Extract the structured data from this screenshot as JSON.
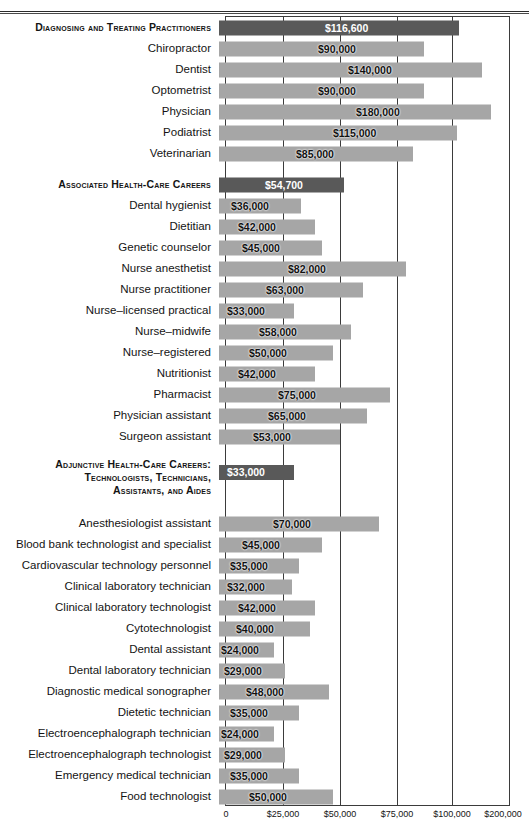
{
  "chart_data": {
    "type": "bar",
    "orientation": "horizontal",
    "title": "",
    "xlabel": "",
    "ylabel": "",
    "grid": true,
    "legend": null,
    "axis_note": "Non-linear axis: equal pixel spacing for 0, $25,000, $50,000, $75,000, $100,000, then $200,000",
    "axis_ticks": [
      {
        "label": "0",
        "value": 0,
        "pos": 226
      },
      {
        "label": "$25,000",
        "value": 25000,
        "pos": 283
      },
      {
        "label": "$50,000",
        "value": 50000,
        "pos": 340
      },
      {
        "label": "$75,000",
        "value": 75000,
        "pos": 397
      },
      {
        "label": "$100,000",
        "value": 100000,
        "pos": 452
      },
      {
        "label": "$200,000",
        "value": 200000,
        "pos": 503
      }
    ],
    "gridline_positions": [
      283,
      340,
      397,
      452
    ],
    "categories": [
      "Diagnosing and Treating Practitioners",
      "Chiropractor",
      "Dentist",
      "Optometrist",
      "Physician",
      "Podiatrist",
      "Veterinarian",
      "Associated Health-Care Careers",
      "Dental hygienist",
      "Dietitian",
      "Genetic counselor",
      "Nurse anesthetist",
      "Nurse practitioner",
      "Nurse–licensed practical",
      "Nurse–midwife",
      "Nurse–registered",
      "Nutritionist",
      "Pharmacist",
      "Physician assistant",
      "Surgeon assistant",
      "Adjunctive Health-Care Careers: Technologists, Technicians, Assistants, and Aides",
      "Anesthesiologist assistant",
      "Blood bank technologist and specialist",
      "Cardiovascular technology personnel",
      "Clinical laboratory technician",
      "Clinical laboratory technologist",
      "Cytotechnologist",
      "Dental assistant",
      "Dental laboratory technician",
      "Diagnostic medical sonographer",
      "Dietetic technician",
      "Electroencephalograph technician",
      "Electroencephalograph technologist",
      "Emergency medical technician",
      "Food technologist"
    ],
    "values": [
      116600,
      90000,
      140000,
      90000,
      180000,
      115000,
      85000,
      54700,
      36000,
      42000,
      45000,
      82000,
      63000,
      33000,
      58000,
      50000,
      42000,
      75000,
      65000,
      53000,
      33000,
      70000,
      45000,
      35000,
      32000,
      42000,
      40000,
      24000,
      29000,
      48000,
      35000,
      24000,
      29000,
      35000,
      50000
    ]
  },
  "colors": {
    "section_bar": "#595959",
    "item_bar": "#a6a6a6",
    "axis": "#3b3b3b",
    "text": "#141414",
    "value_on_dark": "#ffffff"
  },
  "rows": [
    {
      "kind": "section",
      "label": "Diagnosing and Treating Practitioners",
      "value": 116600,
      "value_text": "$116,600",
      "bar_w": 240,
      "label_x": 107
    },
    {
      "kind": "item",
      "label": "Chiropractor",
      "value": 90000,
      "value_text": "$90,000",
      "bar_w": 205,
      "label_x": 100
    },
    {
      "kind": "item",
      "label": "Dentist",
      "value": 140000,
      "value_text": "$140,000",
      "bar_w": 263,
      "label_x": 130
    },
    {
      "kind": "item",
      "label": "Optometrist",
      "value": 90000,
      "value_text": "$90,000",
      "bar_w": 205,
      "label_x": 100
    },
    {
      "kind": "item",
      "label": "Physician",
      "value": 180000,
      "value_text": "$180,000",
      "bar_w": 272,
      "label_x": 138
    },
    {
      "kind": "item",
      "label": "Podiatrist",
      "value": 115000,
      "value_text": "$115,000",
      "bar_w": 238,
      "label_x": 115
    },
    {
      "kind": "item",
      "label": "Veterinarian",
      "value": 85000,
      "value_text": "$85,000",
      "bar_w": 194,
      "label_x": 78
    },
    {
      "kind": "spacer"
    },
    {
      "kind": "section",
      "label": "Associated Health-Care Careers",
      "value": 54700,
      "value_text": "$54,700",
      "bar_w": 125,
      "label_x": 47
    },
    {
      "kind": "item",
      "label": "Dental hygienist",
      "value": 36000,
      "value_text": "$36,000",
      "bar_w": 82,
      "label_x": 13
    },
    {
      "kind": "item",
      "label": "Dietitian",
      "value": 42000,
      "value_text": "$42,000",
      "bar_w": 96,
      "label_x": 20
    },
    {
      "kind": "item",
      "label": "Genetic counselor",
      "value": 45000,
      "value_text": "$45,000",
      "bar_w": 103,
      "label_x": 24
    },
    {
      "kind": "item",
      "label": "Nurse anesthetist",
      "value": 82000,
      "value_text": "$82,000",
      "bar_w": 187,
      "label_x": 70
    },
    {
      "kind": "item",
      "label": "Nurse practitioner",
      "value": 63000,
      "value_text": "$63,000",
      "bar_w": 144,
      "label_x": 48
    },
    {
      "kind": "item",
      "label": "Nurse–licensed practical",
      "value": 33000,
      "value_text": "$33,000",
      "bar_w": 75,
      "label_x": 9
    },
    {
      "kind": "item",
      "label": "Nurse–midwife",
      "value": 58000,
      "value_text": "$58,000",
      "bar_w": 132,
      "label_x": 41
    },
    {
      "kind": "item",
      "label": "Nurse–registered",
      "value": 50000,
      "value_text": "$50,000",
      "bar_w": 114,
      "label_x": 31
    },
    {
      "kind": "item",
      "label": "Nutritionist",
      "value": 42000,
      "value_text": "$42,000",
      "bar_w": 96,
      "label_x": 20
    },
    {
      "kind": "item",
      "label": "Pharmacist",
      "value": 75000,
      "value_text": "$75,000",
      "bar_w": 171,
      "label_x": 60
    },
    {
      "kind": "item",
      "label": "Physician assistant",
      "value": 65000,
      "value_text": "$65,000",
      "bar_w": 148,
      "label_x": 50
    },
    {
      "kind": "item",
      "label": "Surgeon assistant",
      "value": 53000,
      "value_text": "$53,000",
      "bar_w": 121,
      "label_x": 35
    },
    {
      "kind": "spacer"
    },
    {
      "kind": "section-tall",
      "label": "Adjunctive Health-Care Careers:\nTechnologists, Technicians,\nAssistants, and Aides",
      "value": 33000,
      "value_text": "$33,000",
      "bar_w": 75,
      "label_x": 9
    },
    {
      "kind": "item",
      "label": "Anesthesiologist assistant",
      "value": 70000,
      "value_text": "$70,000",
      "bar_w": 160,
      "label_x": 55
    },
    {
      "kind": "item",
      "label": "Blood bank technologist and specialist",
      "value": 45000,
      "value_text": "$45,000",
      "bar_w": 103,
      "label_x": 24
    },
    {
      "kind": "item",
      "label": "Cardiovascular technology personnel",
      "value": 35000,
      "value_text": "$35,000",
      "bar_w": 80,
      "label_x": 12
    },
    {
      "kind": "item",
      "label": "Clinical laboratory technician",
      "value": 32000,
      "value_text": "$32,000",
      "bar_w": 73,
      "label_x": 9
    },
    {
      "kind": "item",
      "label": "Clinical laboratory technologist",
      "value": 42000,
      "value_text": "$42,000",
      "bar_w": 96,
      "label_x": 20
    },
    {
      "kind": "item",
      "label": "Cytotechnologist",
      "value": 40000,
      "value_text": "$40,000",
      "bar_w": 91,
      "label_x": 18
    },
    {
      "kind": "item",
      "label": "Dental assistant",
      "value": 24000,
      "value_text": "$24,000",
      "bar_w": 55,
      "label_x": 3
    },
    {
      "kind": "item",
      "label": "Dental laboratory technician",
      "value": 29000,
      "value_text": "$29,000",
      "bar_w": 66,
      "label_x": 6
    },
    {
      "kind": "item",
      "label": "Diagnostic medical sonographer",
      "value": 48000,
      "value_text": "$48,000",
      "bar_w": 110,
      "label_x": 28
    },
    {
      "kind": "item",
      "label": "Dietetic technician",
      "value": 35000,
      "value_text": "$35,000",
      "bar_w": 80,
      "label_x": 12
    },
    {
      "kind": "item",
      "label": "Electroencephalograph technician",
      "value": 24000,
      "value_text": "$24,000",
      "bar_w": 55,
      "label_x": 3
    },
    {
      "kind": "item",
      "label": "Electroencephalograph technologist",
      "value": 29000,
      "value_text": "$29,000",
      "bar_w": 66,
      "label_x": 6
    },
    {
      "kind": "item",
      "label": "Emergency medical technician",
      "value": 35000,
      "value_text": "$35,000",
      "bar_w": 80,
      "label_x": 12
    },
    {
      "kind": "item",
      "label": "Food technologist",
      "value": 50000,
      "value_text": "$50,000",
      "bar_w": 114,
      "label_x": 31
    }
  ]
}
